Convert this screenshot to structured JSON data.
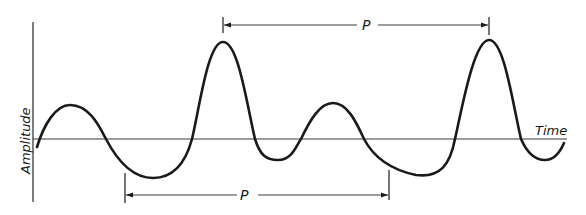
{
  "diagram": {
    "type": "periodic-waveform",
    "axes": {
      "y_label": "Amplitude",
      "x_label": "Time"
    },
    "period_markers": [
      {
        "label": "P",
        "position": "top",
        "from": "first large peak",
        "to": "second large peak"
      },
      {
        "label": "P",
        "position": "bottom",
        "from": "first trough",
        "to": "second trough"
      }
    ],
    "colors": {
      "line": "#1a1a1a",
      "axis": "#3a3a3a",
      "background": "#ffffff"
    }
  }
}
